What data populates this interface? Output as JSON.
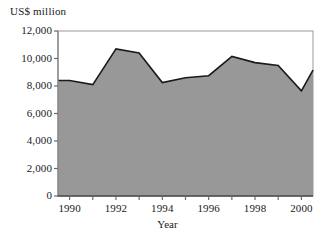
{
  "chart_data": {
    "type": "area",
    "title": "",
    "xlabel": "Year",
    "ylabel": "US$ million",
    "x": [
      1990,
      1991,
      1992,
      1993,
      1994,
      1995,
      1996,
      1997,
      1998,
      1999,
      2000
    ],
    "values": [
      8400,
      8100,
      10700,
      10400,
      8250,
      8600,
      8750,
      10150,
      9700,
      9500,
      7650
    ],
    "end_value": 9150,
    "categories": [
      "1990",
      "1991",
      "1992",
      "1993",
      "1994",
      "1995",
      "1996",
      "1997",
      "1998",
      "1999",
      "2000"
    ],
    "ylim": [
      0,
      12000
    ],
    "xlim": [
      1989.5,
      2000.5
    ],
    "ytick_labels": [
      "0",
      "2,000",
      "4,000",
      "6,000",
      "8,000",
      "10,000",
      "12,000"
    ],
    "ytick_values": [
      0,
      2000,
      4000,
      6000,
      8000,
      10000,
      12000
    ],
    "xtick_labels": [
      "1990",
      "1992",
      "1994",
      "1996",
      "1998",
      "2000"
    ],
    "xtick_values": [
      1990,
      1992,
      1994,
      1996,
      1998,
      2000
    ],
    "grid": false,
    "legend": "none",
    "fill_color": "#989898",
    "line_color": "#1a1a1a",
    "axis_color": "#808080",
    "background": "#ffffff"
  },
  "axis": {
    "y_title": "US$ million",
    "x_title": "Year"
  },
  "ticks": {
    "y": [
      {
        "label": "12,000",
        "top": 25
      },
      {
        "label": "10,000",
        "top": 52
      },
      {
        "label": "8,000",
        "top": 80
      },
      {
        "label": "6,000",
        "top": 108
      },
      {
        "label": "4,000",
        "top": 135
      },
      {
        "label": "2,000",
        "top": 163
      },
      {
        "label": "0",
        "top": 190
      }
    ],
    "x": [
      {
        "label": "1990",
        "left": 50
      },
      {
        "label": "1992",
        "left": 100
      },
      {
        "label": "1994",
        "left": 150
      },
      {
        "label": "1996",
        "left": 200
      },
      {
        "label": "1998",
        "left": 250
      },
      {
        "label": "2000",
        "left": 298
      }
    ]
  }
}
